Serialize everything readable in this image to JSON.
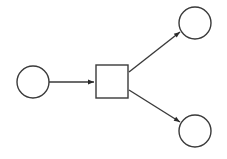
{
  "diagram": {
    "type": "petri-net-fragment",
    "stroke_color": "#3a3a3a",
    "background": "#ffffff",
    "nodes": [
      {
        "id": "p_in",
        "shape": "circle",
        "cx": 33,
        "cy": 82,
        "r": 16
      },
      {
        "id": "t1",
        "shape": "square",
        "x": 96,
        "y": 65,
        "w": 32,
        "h": 33
      },
      {
        "id": "p_out_top",
        "shape": "circle",
        "cx": 195,
        "cy": 23,
        "r": 16
      },
      {
        "id": "p_out_bottom",
        "shape": "circle",
        "cx": 195,
        "cy": 131,
        "r": 16
      }
    ],
    "edges": [
      {
        "from": "p_in",
        "to": "t1"
      },
      {
        "from": "t1",
        "to": "p_out_top"
      },
      {
        "from": "t1",
        "to": "p_out_bottom"
      }
    ]
  }
}
